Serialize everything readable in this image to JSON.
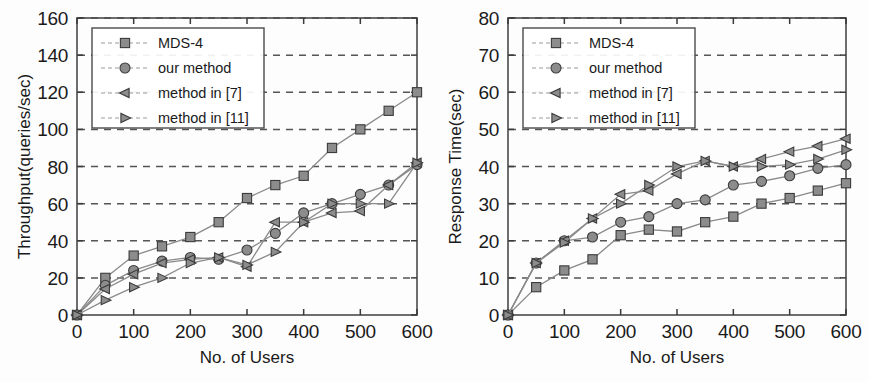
{
  "figure": {
    "name": "two-panel-performance-comparison",
    "background": "#fdfdfd",
    "marker_fill": "#8c8c8c",
    "marker_stroke": "#3b3b3b",
    "line_color": "#8a8a8a",
    "grid_color": "#555555"
  },
  "legend": {
    "entries": [
      {
        "label": "MDS-4",
        "marker": "square-marker"
      },
      {
        "label": "our method",
        "marker": "circle-marker"
      },
      {
        "label": "method in [7]",
        "marker": "triangle-left-marker"
      },
      {
        "label": "method in [11]",
        "marker": "triangle-right-marker"
      }
    ]
  },
  "chart_data": [
    {
      "type": "line",
      "id": "throughput-chart",
      "title": "",
      "xlabel": "No. of Users",
      "ylabel": "Throughput(queries/sec)",
      "xlim": [
        0,
        600
      ],
      "ylim": [
        0,
        160
      ],
      "xticks": [
        0,
        100,
        200,
        300,
        400,
        500,
        600
      ],
      "yticks": [
        0,
        20,
        40,
        60,
        80,
        100,
        120,
        140,
        160
      ],
      "xtick_labels": [
        "0",
        "100",
        "200",
        "300",
        "400",
        "500",
        "600"
      ],
      "ytick_labels": [
        "0",
        "20",
        "40",
        "60",
        "80",
        "100",
        "120",
        "140",
        "160"
      ],
      "grid": true,
      "grid_axis": "y",
      "legend_position": "upper-left",
      "x": [
        0,
        50,
        100,
        150,
        200,
        250,
        300,
        350,
        400,
        450,
        500,
        550,
        600
      ],
      "series": [
        {
          "name": "MDS-4",
          "marker": "square-marker",
          "values": [
            0,
            20,
            32,
            37,
            42,
            50,
            63,
            70,
            75,
            90,
            100,
            110,
            120
          ]
        },
        {
          "name": "our method",
          "marker": "circle-marker",
          "values": [
            0,
            16,
            24,
            29,
            31,
            30,
            35,
            44,
            55,
            60,
            65,
            70,
            81
          ]
        },
        {
          "name": "method in [7]",
          "marker": "triangle-left-marker",
          "values": [
            0,
            14,
            22,
            28,
            30,
            31,
            26,
            50,
            50,
            55,
            56,
            70,
            82
          ]
        },
        {
          "name": "method in [11]",
          "marker": "triangle-right-marker",
          "values": [
            0,
            8,
            15,
            20,
            28,
            31,
            27,
            34,
            50,
            60,
            60,
            60,
            82
          ]
        }
      ]
    },
    {
      "type": "line",
      "id": "response-time-chart",
      "title": "",
      "xlabel": "No. of Users",
      "ylabel": "Response Time(sec)",
      "xlim": [
        0,
        600
      ],
      "ylim": [
        0,
        80
      ],
      "xticks": [
        0,
        100,
        200,
        300,
        400,
        500,
        600
      ],
      "yticks": [
        0,
        10,
        20,
        30,
        40,
        50,
        60,
        70,
        80
      ],
      "xtick_labels": [
        "0",
        "100",
        "200",
        "300",
        "400",
        "500",
        "600"
      ],
      "ytick_labels": [
        "0",
        "10",
        "20",
        "30",
        "40",
        "50",
        "60",
        "70",
        "80"
      ],
      "grid": true,
      "grid_axis": "y",
      "legend_position": "upper-left",
      "x": [
        0,
        50,
        100,
        150,
        200,
        250,
        300,
        350,
        400,
        450,
        500,
        550,
        600
      ],
      "series": [
        {
          "name": "MDS-4",
          "marker": "square-marker",
          "values": [
            0,
            7.5,
            12,
            15,
            21.5,
            23,
            22.5,
            25,
            26.5,
            30,
            31.5,
            33.5,
            35.5
          ]
        },
        {
          "name": "our method",
          "marker": "circle-marker",
          "values": [
            0,
            14,
            20,
            21,
            25,
            26.5,
            30,
            31,
            35,
            36,
            37.5,
            39.5,
            40.5
          ]
        },
        {
          "name": "method in [7]",
          "marker": "triangle-left-marker",
          "values": [
            0,
            14,
            20,
            26,
            32.5,
            33.5,
            38,
            41.5,
            40,
            42,
            44,
            45.5,
            47.5
          ]
        },
        {
          "name": "method in [11]",
          "marker": "triangle-right-marker",
          "values": [
            0,
            14,
            19.5,
            26,
            30,
            35,
            40,
            41.5,
            40,
            40,
            40.5,
            42,
            44.5
          ]
        }
      ]
    }
  ]
}
